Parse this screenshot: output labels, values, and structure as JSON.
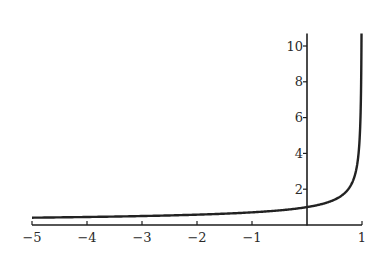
{
  "chart_data": {
    "type": "line",
    "title": "",
    "xlabel": "",
    "ylabel": "",
    "function": "1/sqrt(1-x)",
    "xlim": [
      -5,
      1
    ],
    "ylim": [
      0,
      10.7
    ],
    "grid": false,
    "legend": null,
    "x_ticks": [
      -5,
      -4,
      -3,
      -2,
      -1,
      1
    ],
    "x_tick_labels": [
      "-5",
      "-4",
      "-3",
      "-2",
      "-1",
      "1"
    ],
    "y_ticks": [
      2,
      4,
      6,
      8,
      10
    ],
    "y_tick_labels": [
      "2",
      "4",
      "6",
      "8",
      "10"
    ],
    "series": [
      {
        "name": "curve",
        "x": [
          -5,
          -4,
          -3,
          -2,
          -1,
          -0.5,
          0,
          0.25,
          0.5,
          0.75,
          0.85,
          0.9,
          0.95,
          0.97,
          0.98,
          0.99,
          0.9913
        ],
        "y": [
          0.41,
          0.45,
          0.5,
          0.58,
          0.71,
          0.82,
          1.0,
          1.15,
          1.41,
          2.0,
          2.58,
          3.16,
          4.47,
          5.77,
          7.07,
          10.0,
          10.7
        ]
      }
    ],
    "colors": {
      "curve": "#222222",
      "axis": "#1e1e1e",
      "text": "#2a2a2a"
    }
  }
}
